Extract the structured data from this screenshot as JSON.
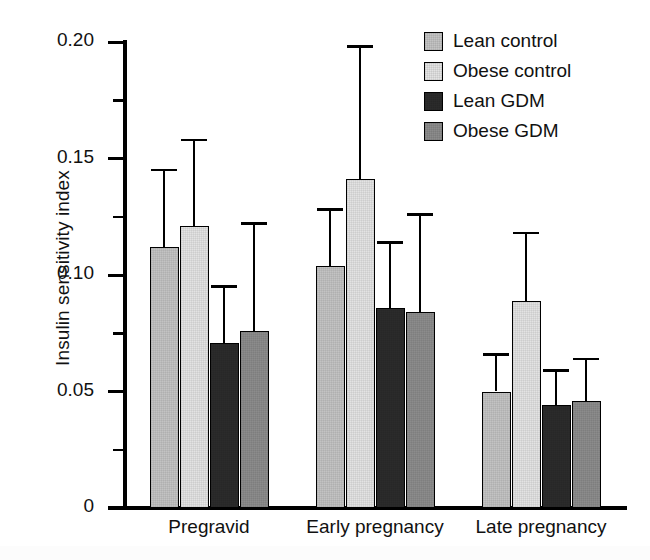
{
  "chart_data": {
    "type": "bar",
    "title": "",
    "xlabel": "",
    "ylabel": "Insulin sensitivity index",
    "categories": [
      "Pregravid",
      "Early pregnancy",
      "Late pregnancy"
    ],
    "ylim": [
      0,
      0.2
    ],
    "ytick_labels": [
      "0",
      "0.05",
      "0.10",
      "0.15",
      "0.20"
    ],
    "ytick_values": [
      0,
      0.05,
      0.1,
      0.15,
      0.2
    ],
    "yminor_values": [
      0.025,
      0.075,
      0.125,
      0.175
    ],
    "grid": false,
    "legend_position": "top-right",
    "error_bar_style": "upper-only",
    "series": [
      {
        "name": "Lean control",
        "color": "#c3c3c3",
        "values": [
          0.112,
          0.104,
          0.05
        ],
        "error_upper": [
          0.145,
          0.128,
          0.066
        ]
      },
      {
        "name": "Obese control",
        "color": "#e3e3e3",
        "values": [
          0.121,
          0.141,
          0.089
        ],
        "error_upper": [
          0.158,
          0.198,
          0.118
        ]
      },
      {
        "name": "Lean GDM",
        "color": "#2b2b2b",
        "values": [
          0.071,
          0.086,
          0.044
        ],
        "error_upper": [
          0.095,
          0.114,
          0.059
        ]
      },
      {
        "name": "Obese GDM",
        "color": "#8c8c8c",
        "values": [
          0.076,
          0.084,
          0.046
        ],
        "error_upper": [
          0.122,
          0.126,
          0.064
        ]
      }
    ]
  }
}
